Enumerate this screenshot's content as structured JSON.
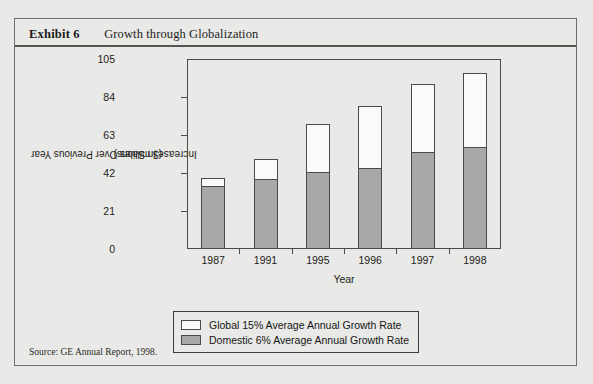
{
  "exhibit": {
    "label": "Exhibit 6",
    "title": "Growth through Globalization",
    "source": "Source: GE Annual Report, 1998."
  },
  "chart_data": {
    "type": "bar",
    "stacked": true,
    "title": "Growth through Globalization",
    "xlabel": "Year",
    "ylabel": "Increase in Sales Over Previous Year ($ millions)",
    "ylabel_line1": "Increase in Sales Over Previous Year",
    "ylabel_line2": "($ millions)",
    "categories": [
      "1987",
      "1991",
      "1995",
      "1996",
      "1997",
      "1998"
    ],
    "ylim": [
      0,
      105
    ],
    "yticks": [
      0,
      21,
      42,
      63,
      84,
      105
    ],
    "ytick_labels": [
      "0",
      "21",
      "42",
      "63",
      "84",
      "105"
    ],
    "grid": false,
    "legend_position": "below-plot",
    "series": [
      {
        "name": "Domestic 6% Average Annual Growth Rate",
        "color": "#a8a8a6",
        "values": [
          34,
          38,
          42,
          44,
          53,
          56
        ]
      },
      {
        "name": "Global 15% Average Annual Growth Rate",
        "color": "#fbfbf9",
        "values": [
          5,
          12,
          27,
          35,
          38,
          41
        ]
      }
    ],
    "totals": [
      39,
      50,
      69,
      79,
      91,
      97
    ],
    "legend": [
      {
        "label": "Global 15% Average Annual Growth Rate",
        "color": "#fbfbf9"
      },
      {
        "label": "Domestic 6% Average Annual Growth Rate",
        "color": "#a8a8a6"
      }
    ]
  }
}
